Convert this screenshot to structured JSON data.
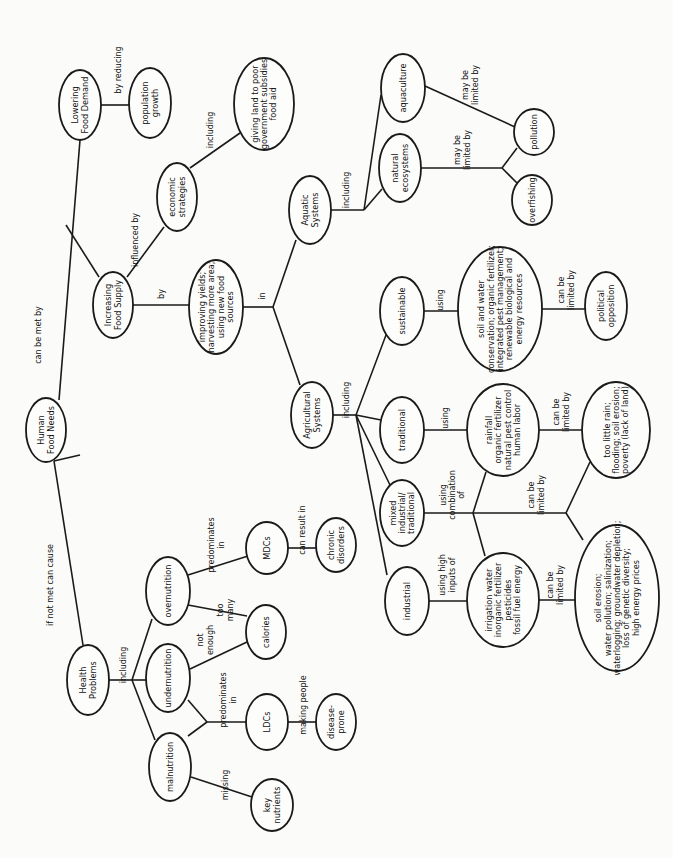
{
  "diagram": {
    "orientation": "rotated -90deg (text reads bottom-to-top)",
    "nodes": [
      {
        "id": "human-food-needs",
        "lines": [
          "Human",
          "Food Needs"
        ],
        "x": 46,
        "y": 430,
        "rx": 20,
        "ry": 32
      },
      {
        "id": "lowering-food-demand",
        "lines": [
          "Lowering",
          "Food Demand"
        ],
        "x": 80,
        "y": 105,
        "rx": 21,
        "ry": 35
      },
      {
        "id": "population-growth",
        "lines": [
          "population",
          "growth"
        ],
        "x": 150,
        "y": 103,
        "rx": 21,
        "ry": 35
      },
      {
        "id": "increasing-food-supply",
        "lines": [
          "Increasing",
          "Food Supply"
        ],
        "x": 113,
        "y": 305,
        "rx": 20,
        "ry": 33
      },
      {
        "id": "economic-strategies",
        "lines": [
          "economic",
          "strategies"
        ],
        "x": 177,
        "y": 197,
        "rx": 20,
        "ry": 34
      },
      {
        "id": "giving-land",
        "lines": [
          "giving land to poor",
          "government subsidies",
          "food aid"
        ],
        "x": 264,
        "y": 104,
        "rx": 30,
        "ry": 46
      },
      {
        "id": "improving-yields",
        "lines": [
          "improving yields;",
          "harvesting more area;",
          "using new food",
          "sources"
        ],
        "x": 216,
        "y": 307,
        "rx": 27,
        "ry": 47
      },
      {
        "id": "aquatic-systems",
        "lines": [
          "Aquatic",
          "Systems"
        ],
        "x": 310,
        "y": 210,
        "rx": 21,
        "ry": 34
      },
      {
        "id": "agricultural-systems",
        "lines": [
          "Agricultural",
          "Systems"
        ],
        "x": 312,
        "y": 415,
        "rx": 21,
        "ry": 33
      },
      {
        "id": "aquaculture",
        "lines": [
          "aquaculture"
        ],
        "x": 403,
        "y": 88,
        "rx": 22,
        "ry": 34
      },
      {
        "id": "natural-ecosystems",
        "lines": [
          "natural",
          "ecosystems"
        ],
        "x": 400,
        "y": 168,
        "rx": 21,
        "ry": 34
      },
      {
        "id": "pollution",
        "lines": [
          "pollution"
        ],
        "x": 534,
        "y": 132,
        "rx": 20,
        "ry": 23
      },
      {
        "id": "overfishing",
        "lines": [
          "overfishing"
        ],
        "x": 532,
        "y": 200,
        "rx": 20,
        "ry": 25
      },
      {
        "id": "sustainable",
        "lines": [
          "sustainable"
        ],
        "x": 402,
        "y": 311,
        "rx": 22,
        "ry": 34
      },
      {
        "id": "traditional",
        "lines": [
          "traditional"
        ],
        "x": 402,
        "y": 430,
        "rx": 22,
        "ry": 33
      },
      {
        "id": "mixed",
        "lines": [
          "mixed",
          "industrial/",
          "traditional"
        ],
        "x": 402,
        "y": 513,
        "rx": 22,
        "ry": 33
      },
      {
        "id": "industrial",
        "lines": [
          "industrial"
        ],
        "x": 407,
        "y": 601,
        "rx": 22,
        "ry": 34
      },
      {
        "id": "soil-water-conservation",
        "lines": [
          "soil and water",
          "conservation; organic fertilizer;",
          "integrated pest management;",
          "renewable biological and",
          "energy resources"
        ],
        "x": 500,
        "y": 309,
        "rx": 42,
        "ry": 62
      },
      {
        "id": "rainfall",
        "lines": [
          "rainfall",
          "organic fertilizer",
          "natural pest control",
          "human labor"
        ],
        "x": 503,
        "y": 430,
        "rx": 36,
        "ry": 46
      },
      {
        "id": "irrigation",
        "lines": [
          "irrigation water",
          "inorganic fertilizer",
          "pesticides",
          "fossil fuel energy"
        ],
        "x": 503,
        "y": 600,
        "rx": 36,
        "ry": 47
      },
      {
        "id": "political-opposition",
        "lines": [
          "political",
          "opposition"
        ],
        "x": 606,
        "y": 306,
        "rx": 21,
        "ry": 34
      },
      {
        "id": "too-little-rain",
        "lines": [
          "too little rain;",
          "flooding; soil erosion;",
          "poverty (lack of land)"
        ],
        "x": 616,
        "y": 430,
        "rx": 34,
        "ry": 48
      },
      {
        "id": "soil-erosion-list",
        "lines": [
          "soil erosion;",
          "water pollution; salinization;",
          "waterlogging; groundwater depletion;",
          "loss of genetic diversity;",
          "high energy prices"
        ],
        "x": 617,
        "y": 598,
        "rx": 42,
        "ry": 73
      },
      {
        "id": "health-problems",
        "lines": [
          "Health",
          "Problems"
        ],
        "x": 88,
        "y": 680,
        "rx": 21,
        "ry": 35
      },
      {
        "id": "overnutrition",
        "lines": [
          "overnutrition"
        ],
        "x": 168,
        "y": 591,
        "rx": 22,
        "ry": 34
      },
      {
        "id": "undernutrition",
        "lines": [
          "undernutrition"
        ],
        "x": 168,
        "y": 678,
        "rx": 22,
        "ry": 34
      },
      {
        "id": "malnutrition",
        "lines": [
          "malnutrition"
        ],
        "x": 170,
        "y": 767,
        "rx": 21,
        "ry": 34
      },
      {
        "id": "mdcs",
        "lines": [
          "MDCs"
        ],
        "x": 267,
        "y": 548,
        "rx": 21,
        "ry": 26
      },
      {
        "id": "calories",
        "lines": [
          "calories"
        ],
        "x": 266,
        "y": 632,
        "rx": 20,
        "ry": 27
      },
      {
        "id": "ldcs",
        "lines": [
          "LDCs"
        ],
        "x": 267,
        "y": 722,
        "rx": 21,
        "ry": 28
      },
      {
        "id": "key-nutrients",
        "lines": [
          "key",
          "nutrients"
        ],
        "x": 272,
        "y": 805,
        "rx": 21,
        "ry": 26
      },
      {
        "id": "chronic-disorders",
        "lines": [
          "chronic",
          "disorders"
        ],
        "x": 336,
        "y": 545,
        "rx": 20,
        "ry": 27
      },
      {
        "id": "disease-prone",
        "lines": [
          "disease-",
          "prone"
        ],
        "x": 336,
        "y": 722,
        "rx": 20,
        "ry": 28
      }
    ],
    "edges": [
      {
        "points": [
          [
            59,
            400
          ],
          [
            80,
            140
          ]
        ]
      },
      {
        "points": [
          [
            66,
            225
          ],
          [
            99,
            277
          ]
        ]
      },
      {
        "points": [
          [
            101,
            105
          ],
          [
            129,
            105
          ]
        ]
      },
      {
        "points": [
          [
            127,
            277
          ],
          [
            164,
            227
          ]
        ]
      },
      {
        "points": [
          [
            190,
            168
          ],
          [
            240,
            133
          ]
        ]
      },
      {
        "points": [
          [
            133,
            305
          ],
          [
            189,
            305
          ]
        ]
      },
      {
        "points": [
          [
            243,
            307
          ],
          [
            273,
            307
          ]
        ]
      },
      {
        "points": [
          [
            273,
            307
          ],
          [
            296,
            240
          ]
        ]
      },
      {
        "points": [
          [
            273,
            307
          ],
          [
            300,
            385
          ]
        ]
      },
      {
        "points": [
          [
            331,
            210
          ],
          [
            364,
            210
          ]
        ]
      },
      {
        "points": [
          [
            364,
            210
          ],
          [
            381,
            95
          ]
        ]
      },
      {
        "points": [
          [
            364,
            210
          ],
          [
            382,
            189
          ]
        ]
      },
      {
        "points": [
          [
            425,
            86
          ],
          [
            515,
            127
          ]
        ]
      },
      {
        "points": [
          [
            421,
            168
          ],
          [
            502,
            168
          ]
        ]
      },
      {
        "points": [
          [
            502,
            168
          ],
          [
            517,
            148
          ]
        ]
      },
      {
        "points": [
          [
            502,
            168
          ],
          [
            517,
            183
          ]
        ]
      },
      {
        "points": [
          [
            333,
            415
          ],
          [
            356,
            415
          ]
        ]
      },
      {
        "points": [
          [
            356,
            415
          ],
          [
            386,
            335
          ]
        ]
      },
      {
        "points": [
          [
            356,
            415
          ],
          [
            381,
            420
          ]
        ]
      },
      {
        "points": [
          [
            356,
            415
          ],
          [
            390,
            485
          ]
        ]
      },
      {
        "points": [
          [
            356,
            415
          ],
          [
            387,
            575
          ]
        ]
      },
      {
        "points": [
          [
            424,
            311
          ],
          [
            458,
            311
          ]
        ]
      },
      {
        "points": [
          [
            542,
            309
          ],
          [
            585,
            309
          ]
        ]
      },
      {
        "points": [
          [
            424,
            430
          ],
          [
            467,
            430
          ]
        ]
      },
      {
        "points": [
          [
            539,
            430
          ],
          [
            582,
            430
          ]
        ]
      },
      {
        "points": [
          [
            424,
            513
          ],
          [
            473,
            513
          ]
        ]
      },
      {
        "points": [
          [
            473,
            513
          ],
          [
            486,
            472
          ]
        ]
      },
      {
        "points": [
          [
            473,
            513
          ],
          [
            485,
            556
          ]
        ]
      },
      {
        "points": [
          [
            473,
            513
          ],
          [
            566,
            513
          ]
        ]
      },
      {
        "points": [
          [
            566,
            513
          ],
          [
            590,
            462
          ]
        ]
      },
      {
        "points": [
          [
            566,
            513
          ],
          [
            583,
            540
          ]
        ]
      },
      {
        "points": [
          [
            429,
            601
          ],
          [
            467,
            601
          ]
        ]
      },
      {
        "points": [
          [
            539,
            600
          ],
          [
            575,
            600
          ]
        ]
      },
      {
        "points": [
          [
            80,
            455
          ],
          [
            54,
            461
          ]
        ]
      },
      {
        "points": [
          [
            54,
            461
          ],
          [
            83,
            645
          ]
        ]
      },
      {
        "points": [
          [
            109,
            680
          ],
          [
            132,
            680
          ]
        ]
      },
      {
        "points": [
          [
            132,
            680
          ],
          [
            152,
            619
          ]
        ]
      },
      {
        "points": [
          [
            132,
            680
          ],
          [
            146,
            680
          ]
        ]
      },
      {
        "points": [
          [
            132,
            680
          ],
          [
            155,
            740
          ]
        ]
      },
      {
        "points": [
          [
            188,
            575
          ],
          [
            248,
            556
          ]
        ]
      },
      {
        "points": [
          [
            188,
            605
          ],
          [
            247,
            616
          ]
        ]
      },
      {
        "points": [
          [
            190,
            669
          ],
          [
            247,
            642
          ]
        ]
      },
      {
        "points": [
          [
            188,
            700
          ],
          [
            207,
            722
          ]
        ]
      },
      {
        "points": [
          [
            188,
            736
          ],
          [
            207,
            722
          ]
        ]
      },
      {
        "points": [
          [
            207,
            722
          ],
          [
            246,
            722
          ]
        ]
      },
      {
        "points": [
          [
            191,
            777
          ],
          [
            252,
            797
          ]
        ]
      },
      {
        "points": [
          [
            288,
            548
          ],
          [
            316,
            548
          ]
        ]
      },
      {
        "points": [
          [
            288,
            722
          ],
          [
            316,
            722
          ]
        ]
      }
    ],
    "edge_labels": [
      {
        "lines": [
          "can be met by"
        ],
        "x": 38,
        "y": 335
      },
      {
        "lines": [
          "if not met can cause"
        ],
        "x": 50,
        "y": 585
      },
      {
        "lines": [
          "by reducing"
        ],
        "x": 118,
        "y": 70
      },
      {
        "lines": [
          "influenced by"
        ],
        "x": 135,
        "y": 240
      },
      {
        "lines": [
          "including"
        ],
        "x": 210,
        "y": 130
      },
      {
        "lines": [
          "by"
        ],
        "x": 161,
        "y": 294
      },
      {
        "lines": [
          "in"
        ],
        "x": 262,
        "y": 296
      },
      {
        "lines": [
          "including"
        ],
        "x": 346,
        "y": 190
      },
      {
        "lines": [
          "may be",
          "limited by"
        ],
        "x": 470,
        "y": 85
      },
      {
        "lines": [
          "may be",
          "limited by"
        ],
        "x": 462,
        "y": 150
      },
      {
        "lines": [
          "including"
        ],
        "x": 346,
        "y": 400
      },
      {
        "lines": [
          "using"
        ],
        "x": 440,
        "y": 300
      },
      {
        "lines": [
          "can be",
          "limited by"
        ],
        "x": 566,
        "y": 290
      },
      {
        "lines": [
          "using"
        ],
        "x": 445,
        "y": 418
      },
      {
        "lines": [
          "can be",
          "limited by"
        ],
        "x": 561,
        "y": 412
      },
      {
        "lines": [
          "using",
          "combination",
          "of"
        ],
        "x": 452,
        "y": 495
      },
      {
        "lines": [
          "can be",
          "limited by"
        ],
        "x": 536,
        "y": 495
      },
      {
        "lines": [
          "using high",
          "inputs of"
        ],
        "x": 447,
        "y": 575
      },
      {
        "lines": [
          "can be",
          "limited by"
        ],
        "x": 555,
        "y": 585
      },
      {
        "lines": [
          "including"
        ],
        "x": 123,
        "y": 665
      },
      {
        "lines": [
          "predominates",
          "in"
        ],
        "x": 216,
        "y": 545
      },
      {
        "lines": [
          "too",
          "many"
        ],
        "x": 225,
        "y": 610
      },
      {
        "lines": [
          "not",
          "enough"
        ],
        "x": 205,
        "y": 640
      },
      {
        "lines": [
          "predominates",
          "in"
        ],
        "x": 228,
        "y": 700
      },
      {
        "lines": [
          "missing"
        ],
        "x": 225,
        "y": 785
      },
      {
        "lines": [
          "can result in"
        ],
        "x": 302,
        "y": 530
      },
      {
        "lines": [
          "making people"
        ],
        "x": 303,
        "y": 705
      }
    ]
  }
}
